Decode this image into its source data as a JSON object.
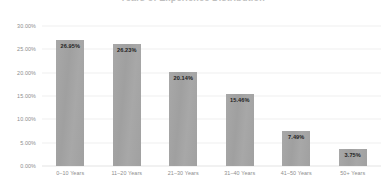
{
  "chart_data": {
    "type": "bar",
    "title": "Years of Experience Distribution",
    "xlabel": "",
    "ylabel": "",
    "ylim": [
      0,
      30
    ],
    "grid": true,
    "legend": false,
    "categories": [
      "0–10 Years",
      "11–20 Years",
      "21–30 Years",
      "31–40 Years",
      "41–50 Years",
      "50+ Years"
    ],
    "values": [
      26.95,
      26.23,
      20.14,
      15.46,
      7.49,
      3.75
    ],
    "data_labels": [
      "26.95%",
      "26.23%",
      "20.14%",
      "15.46%",
      "7.49%",
      "3.75%"
    ],
    "y_ticks": [
      30,
      25,
      20,
      15,
      10,
      5,
      0
    ],
    "y_tick_labels": [
      "30.00%",
      "25.00%",
      "20.00%",
      "15.00%",
      "10.00%",
      "5.00%",
      "0.00%"
    ],
    "series": [
      {
        "name": "Percent of Respondents",
        "values": [
          26.95,
          26.23,
          20.14,
          15.46,
          7.49,
          3.75
        ]
      }
    ],
    "colors": {
      "bar_fill": "#a3a3a3",
      "gridline": "#f0f0f0",
      "baseline": "#e3e3e3",
      "tick_text": "#8d8d8d",
      "label_text": "#1f1f1f",
      "background": "#ffffff"
    }
  }
}
